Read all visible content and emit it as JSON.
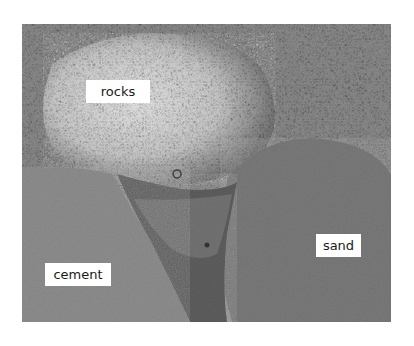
{
  "image": {
    "description": "Grayscale photograph of three ground materials: a heap of light rocks/gravel at top, a cement slab at lower left, and sand at lower right, separated by a dark wet crack",
    "colors": {
      "background": "#ffffff",
      "rocks_light": "#c8c8c8",
      "rocks_dark": "#5a5a5a",
      "cement": "#8c8c8c",
      "sand": "#7a7a7a",
      "crack": "#4a4a4a",
      "label_bg": "#ffffff",
      "label_text": "#1a1a1a"
    }
  },
  "labels": {
    "rocks": "rocks",
    "cement": "cement",
    "sand": "sand"
  }
}
